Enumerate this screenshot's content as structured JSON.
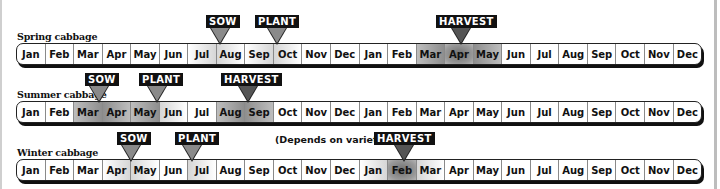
{
  "months": [
    "Jan",
    "Feb",
    "Mar",
    "Apr",
    "May",
    "Jun",
    "Jul",
    "Aug",
    "Sep",
    "Oct",
    "Nov",
    "Dec",
    "Jan",
    "Feb",
    "Mar",
    "Apr",
    "May",
    "Jun",
    "Jul",
    "Aug",
    "Sep",
    "Oct",
    "Nov",
    "Dec"
  ],
  "rows": [
    {
      "label": "Spring cabbage",
      "markers": [
        {
          "label": "SOW",
          "position": "Jul/Aug"
        },
        {
          "label": "PLANT",
          "position": "Sep/Oct"
        },
        {
          "label": "HARVEST",
          "position": "Apr (year 2)"
        }
      ]
    },
    {
      "label": "Summer cabbage",
      "markers": [
        {
          "label": "SOW",
          "position": "Mar/Apr"
        },
        {
          "label": "PLANT",
          "position": "May/Jun"
        },
        {
          "label": "HARVEST",
          "position": "Aug/Sep"
        }
      ]
    },
    {
      "label": "Winter cabbage",
      "note": "(Depends on variety)",
      "markers": [
        {
          "label": "SOW",
          "position": "Apr/May"
        },
        {
          "label": "PLANT",
          "position": "Jun/Jul"
        },
        {
          "label": "HARVEST",
          "position": "Feb (year 2)"
        }
      ]
    }
  ],
  "colors": {
    "tag_bg": "#111111",
    "tag_text": "#ffffff",
    "pointer_light": "#8a8a8a",
    "pointer_dark": "#555555"
  }
}
